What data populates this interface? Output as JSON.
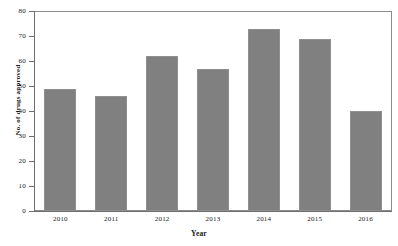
{
  "chart_data": {
    "type": "bar",
    "title": "",
    "subtitle": "",
    "xlabel": "Year",
    "ylabel": "No. of drugs approved",
    "categories": [
      "2010",
      "2011",
      "2012",
      "2013",
      "2014",
      "2015",
      "2016"
    ],
    "values": [
      49,
      46,
      62,
      57,
      73,
      69,
      40
    ],
    "series": [
      {
        "name": "No. of drugs approved",
        "values": [
          49,
          46,
          62,
          57,
          73,
          69,
          40
        ]
      }
    ],
    "ylim": [
      0,
      80
    ],
    "ytick_step": 10,
    "yticks": [
      "0",
      "10",
      "20",
      "30",
      "40",
      "50",
      "60",
      "70",
      "80"
    ],
    "grid": false,
    "legend": false,
    "legend_position": "none",
    "bar_color": "#808080",
    "bar_edge_color": "#8f8f8f",
    "background_color": "#ffffff",
    "axis_color": "#6e6e6e",
    "annotations": []
  },
  "axes": {
    "y_title": "No. of drugs approved",
    "x_title": "Year"
  }
}
